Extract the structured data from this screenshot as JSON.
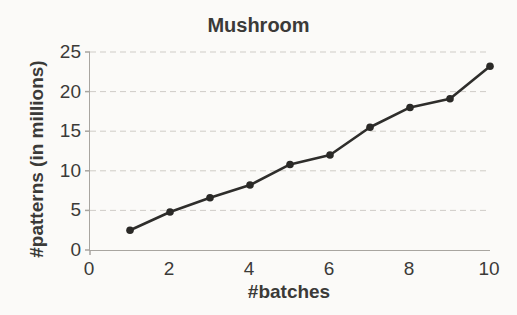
{
  "chart_data": {
    "type": "line",
    "title": "Mushroom",
    "xlabel": "#batches",
    "ylabel": "#patterns (in millions)",
    "x": [
      1,
      2,
      3,
      4,
      5,
      6,
      7,
      8,
      9,
      10
    ],
    "series": [
      {
        "name": "patterns",
        "values": [
          2.5,
          4.8,
          6.6,
          8.2,
          10.8,
          12.0,
          15.5,
          18.0,
          19.1,
          23.2
        ]
      }
    ],
    "xlim": [
      0,
      10
    ],
    "ylim": [
      0,
      25
    ],
    "xticks": [
      0,
      2,
      4,
      6,
      8,
      10
    ],
    "yticks": [
      0,
      5,
      10,
      15,
      20,
      25
    ],
    "grid": true,
    "legend_position": "none",
    "marker": "circle",
    "line_color": "#2e2d2b",
    "marker_color": "#2a2927",
    "grid_color": "#cfccc7",
    "axis_color": "#a8a5a0",
    "text_color": "#3b3a38"
  }
}
